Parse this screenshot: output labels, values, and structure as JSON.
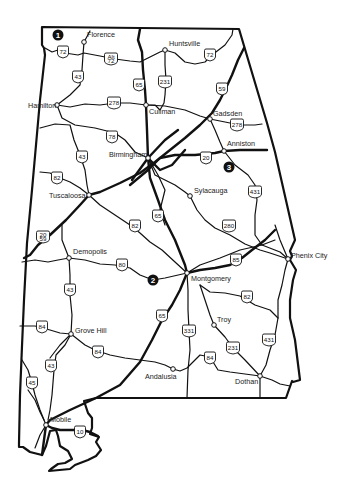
{
  "map": {
    "region": "Alabama",
    "background": "#ffffff",
    "ink": "#111111",
    "cities": [
      {
        "name": "Florence",
        "x": 84,
        "y": 42,
        "lx": 87,
        "ly": 37
      },
      {
        "name": "Huntsville",
        "x": 165,
        "y": 50,
        "lx": 169,
        "ly": 46
      },
      {
        "name": "Hamilton",
        "x": 57,
        "y": 105,
        "lx": 28,
        "ly": 108
      },
      {
        "name": "Cullman",
        "x": 146,
        "y": 105,
        "lx": 149,
        "ly": 114
      },
      {
        "name": "Gadsden",
        "x": 210,
        "y": 119,
        "lx": 213,
        "ly": 116
      },
      {
        "name": "Anniston",
        "x": 224,
        "y": 151,
        "lx": 227,
        "ly": 146
      },
      {
        "name": "Birmingham",
        "x": 148,
        "y": 158,
        "lx": 109,
        "ly": 157
      },
      {
        "name": "Tuscaloosa",
        "x": 89,
        "y": 195,
        "lx": 49,
        "ly": 198
      },
      {
        "name": "Sylacauga",
        "x": 190,
        "y": 196,
        "lx": 194,
        "ly": 193
      },
      {
        "name": "Demopolis",
        "x": 69,
        "y": 258,
        "lx": 73,
        "ly": 254
      },
      {
        "name": "Phenix City",
        "x": 288,
        "y": 259,
        "lx": 291,
        "ly": 258
      },
      {
        "name": "Montgomery",
        "x": 187,
        "y": 273,
        "lx": 191,
        "ly": 281
      },
      {
        "name": "Grove Hill",
        "x": 71,
        "y": 334,
        "lx": 75,
        "ly": 333
      },
      {
        "name": "Troy",
        "x": 214,
        "y": 325,
        "lx": 217,
        "ly": 322
      },
      {
        "name": "Andalusia",
        "x": 173,
        "y": 369,
        "lx": 145,
        "ly": 379
      },
      {
        "name": "Dothan",
        "x": 260,
        "y": 376,
        "lx": 235,
        "ly": 384
      },
      {
        "name": "Mobile",
        "x": 46,
        "y": 425,
        "lx": 50,
        "ly": 422
      }
    ],
    "shields": [
      {
        "label": "72",
        "x": 63,
        "y": 52
      },
      {
        "label": "Alt 72",
        "x": 111,
        "y": 59
      },
      {
        "label": "72",
        "x": 210,
        "y": 55
      },
      {
        "label": "43",
        "x": 78,
        "y": 77
      },
      {
        "label": "65",
        "x": 139,
        "y": 85
      },
      {
        "label": "231",
        "x": 165,
        "y": 82
      },
      {
        "label": "59",
        "x": 222,
        "y": 89
      },
      {
        "label": "278",
        "x": 114,
        "y": 103
      },
      {
        "label": "278",
        "x": 237,
        "y": 125
      },
      {
        "label": "78",
        "x": 112,
        "y": 137
      },
      {
        "label": "43",
        "x": 82,
        "y": 157
      },
      {
        "label": "20",
        "x": 206,
        "y": 158
      },
      {
        "label": "82",
        "x": 57,
        "y": 178
      },
      {
        "label": "431",
        "x": 255,
        "y": 192
      },
      {
        "label": "65",
        "x": 158,
        "y": 216
      },
      {
        "label": "82",
        "x": 135,
        "y": 226
      },
      {
        "label": "280",
        "x": 229,
        "y": 226
      },
      {
        "label": "20/59",
        "x": 43,
        "y": 237
      },
      {
        "label": "85",
        "x": 236,
        "y": 260
      },
      {
        "label": "80",
        "x": 122,
        "y": 265
      },
      {
        "label": "82",
        "x": 247,
        "y": 297
      },
      {
        "label": "43",
        "x": 70,
        "y": 290
      },
      {
        "label": "65",
        "x": 162,
        "y": 316
      },
      {
        "label": "331",
        "x": 189,
        "y": 331
      },
      {
        "label": "84",
        "x": 42,
        "y": 327
      },
      {
        "label": "84",
        "x": 98,
        "y": 352
      },
      {
        "label": "231",
        "x": 233,
        "y": 348
      },
      {
        "label": "431",
        "x": 269,
        "y": 340
      },
      {
        "label": "84",
        "x": 210,
        "y": 358
      },
      {
        "label": "43",
        "x": 51,
        "y": 366
      },
      {
        "label": "45",
        "x": 32,
        "y": 383
      },
      {
        "label": "10",
        "x": 80,
        "y": 432
      }
    ],
    "markers": [
      {
        "label": "1",
        "x": 58,
        "y": 35
      },
      {
        "label": "2",
        "x": 153,
        "y": 280
      },
      {
        "label": "3",
        "x": 229,
        "y": 167
      }
    ]
  }
}
